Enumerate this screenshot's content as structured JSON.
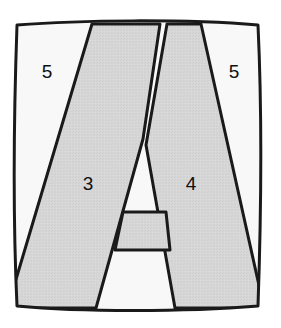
{
  "figure": {
    "shape_name": "letter-a",
    "colors": {
      "stroke": "#1a1a1a",
      "gray_fill": "#d6d6d6",
      "white_fill": "#f8f8f8",
      "background": "#ffffff",
      "label_color": "#101010"
    },
    "stroke_width": 3,
    "regions": [
      {
        "id": "left-outer",
        "label": "5",
        "x": 47,
        "y": 73,
        "fill": "white"
      },
      {
        "id": "right-outer",
        "label": "5",
        "x": 234,
        "y": 73,
        "fill": "white"
      },
      {
        "id": "left-stroke",
        "label": "3",
        "x": 88,
        "y": 185,
        "fill": "gray"
      },
      {
        "id": "right-stroke",
        "label": "4",
        "x": 191,
        "y": 185,
        "fill": "gray"
      }
    ],
    "frame": {
      "name": "outer-frame",
      "path": "M 17,25 C 80,20 185,19 258,25 C 262,110 261,220 258,306 C 185,312 80,312 17,306 C 13,220 14,110 17,25 Z"
    },
    "letter_a": {
      "name": "letter-a-glyph",
      "left_stroke_path": "M 92,25 L 158,25 L 139,136 L 96,306 L 17,306 L 16,284 Z",
      "right_stroke_path": "M 168,25 L 200,25 L 258,292 L 258,306 L 175,306 L 147,142 Z",
      "crossbar_top_path": "M 123,212 L 166,212 L 168,250 L 116,250 Z"
    },
    "counters": [
      {
        "name": "upper-counter",
        "path": "M 143,140 L 166,212 L 123,212 Z",
        "fill": "white"
      },
      {
        "name": "lower-counter",
        "path": "M 116,250 L 168,250 L 175,306 L 96,306 Z",
        "fill": "white"
      }
    ],
    "crossbars": [
      {
        "name": "crossbar-upper",
        "y": 212
      },
      {
        "name": "crossbar-lower",
        "y": 250
      }
    ]
  }
}
